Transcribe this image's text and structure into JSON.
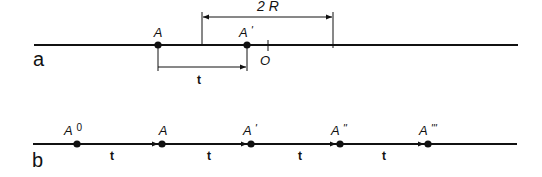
{
  "diagram": {
    "panel_a": {
      "label": "a",
      "points": [
        {
          "name": "A",
          "sup": ""
        },
        {
          "name": "A",
          "sup": "'"
        }
      ],
      "origin_label": "O",
      "span_label": "2 R",
      "step_label": "t"
    },
    "panel_b": {
      "label": "b",
      "points": [
        {
          "name": "A",
          "sup": "0"
        },
        {
          "name": "A",
          "sup": ""
        },
        {
          "name": "A",
          "sup": "'"
        },
        {
          "name": "A",
          "sup": "''"
        },
        {
          "name": "A",
          "sup": "'''"
        }
      ],
      "step_labels": [
        "t",
        "t",
        "t",
        "t"
      ]
    },
    "colors": {
      "line": "#111111",
      "background": "#ffffff"
    }
  }
}
